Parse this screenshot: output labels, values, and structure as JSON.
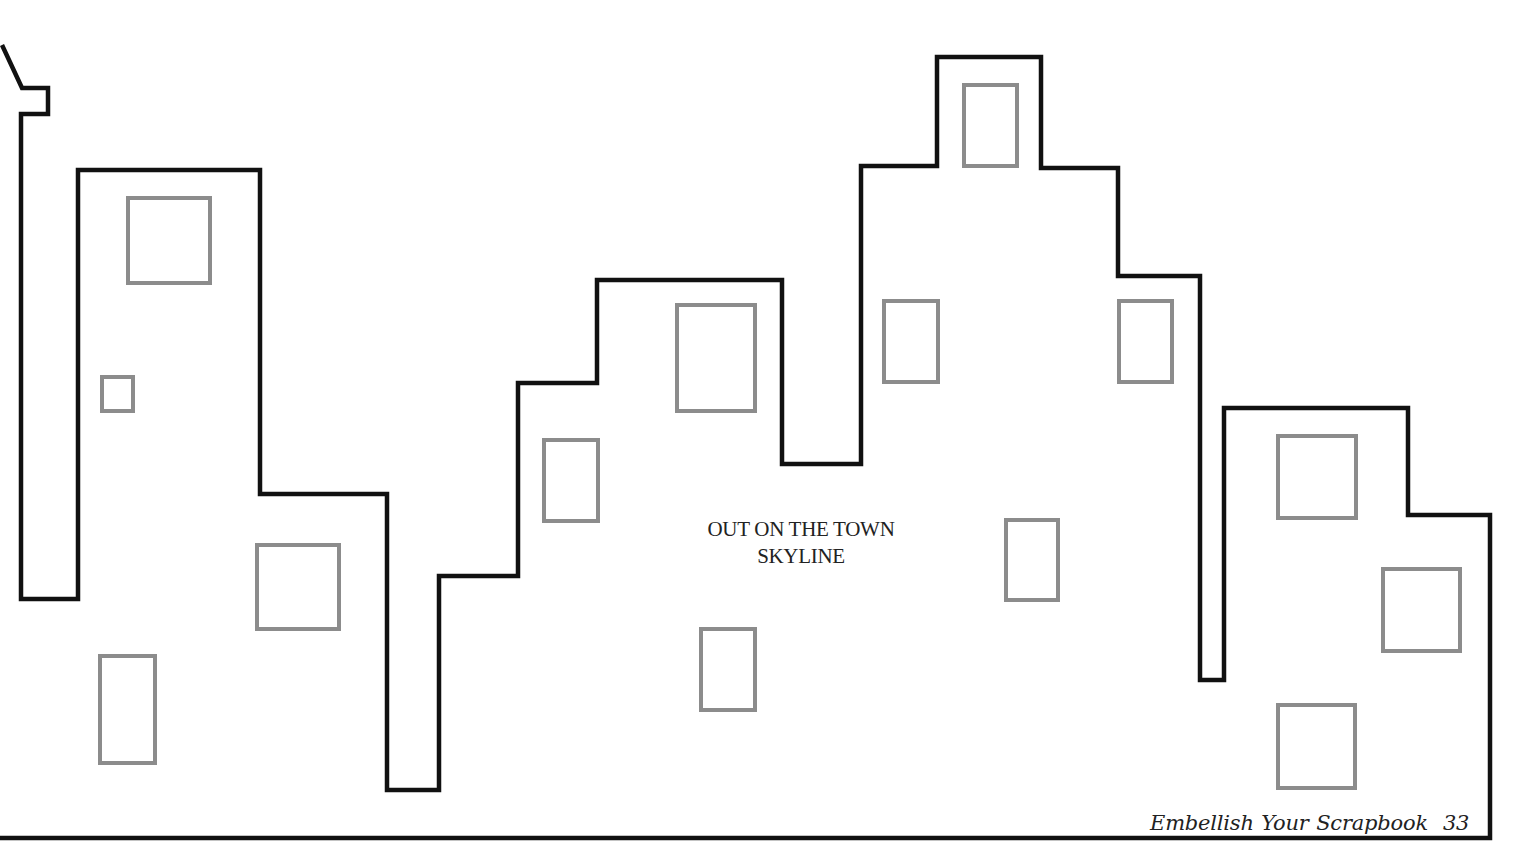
{
  "template": {
    "title_line1": "OUT ON THE TOWN",
    "title_line2": "SKYLINE"
  },
  "footer": {
    "book_title": "Embellish Your Scrapbook",
    "page_number": "33"
  },
  "colors": {
    "outline": "#111111",
    "windows": "#8c8c8c",
    "background": "#ffffff"
  }
}
